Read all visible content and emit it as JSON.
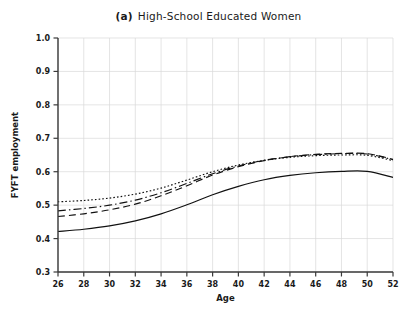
{
  "chart_data": {
    "type": "line",
    "title_parts": {
      "panel": "(a)",
      "text": "High-School Educated Women"
    },
    "xlabel": "Age",
    "ylabel": "FYFT employment",
    "xlim": [
      26,
      52
    ],
    "ylim": [
      0.3,
      1.0
    ],
    "xticks": [
      26,
      28,
      30,
      32,
      34,
      36,
      38,
      40,
      42,
      44,
      46,
      48,
      50,
      52
    ],
    "yticks": [
      "1.0",
      "0.9",
      "0.8",
      "0.7",
      "0.6",
      "0.5",
      "0.4",
      "0.3"
    ],
    "grid": true,
    "legend": "none",
    "x": [
      26,
      28,
      30,
      32,
      34,
      36,
      38,
      40,
      42,
      44,
      46,
      48,
      50,
      52
    ],
    "series": [
      {
        "name": "series-dotted",
        "style": "dotted",
        "values": [
          0.51,
          0.514,
          0.521,
          0.533,
          0.551,
          0.575,
          0.6,
          0.62,
          0.634,
          0.643,
          0.648,
          0.65,
          0.649,
          0.633
        ]
      },
      {
        "name": "series-dashdot",
        "style": "dashdot",
        "values": [
          0.483,
          0.49,
          0.5,
          0.515,
          0.537,
          0.565,
          0.594,
          0.617,
          0.634,
          0.645,
          0.651,
          0.654,
          0.653,
          0.636
        ]
      },
      {
        "name": "series-dashed",
        "style": "dashed",
        "values": [
          0.466,
          0.474,
          0.486,
          0.503,
          0.528,
          0.558,
          0.59,
          0.615,
          0.633,
          0.645,
          0.652,
          0.655,
          0.654,
          0.637
        ]
      },
      {
        "name": "series-solid",
        "style": "solid",
        "values": [
          0.421,
          0.428,
          0.438,
          0.453,
          0.474,
          0.501,
          0.531,
          0.556,
          0.576,
          0.589,
          0.597,
          0.601,
          0.601,
          0.583
        ]
      }
    ]
  }
}
